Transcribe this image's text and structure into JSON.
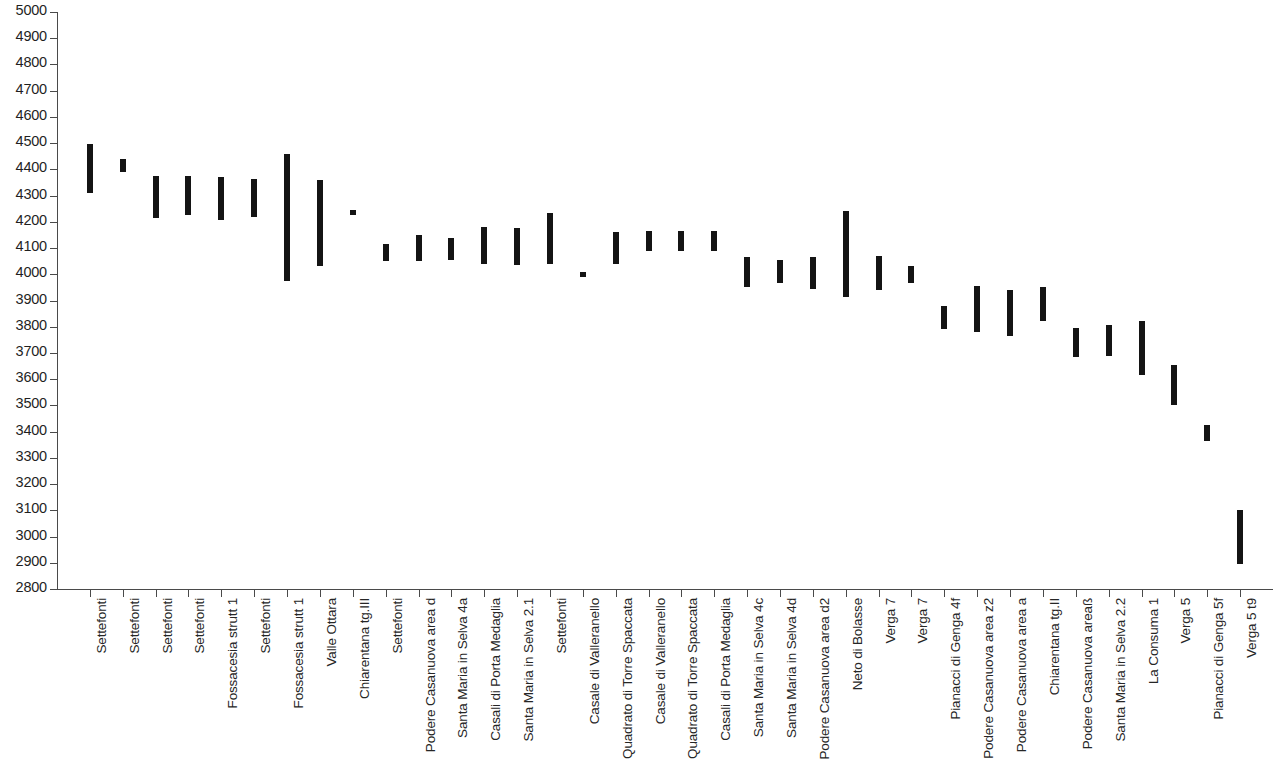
{
  "chart_data": {
    "type": "bar",
    "subtype": "floating-range-bar",
    "title": "",
    "subtitle": "",
    "xlabel": "",
    "ylabel": "",
    "ylim": [
      2800,
      5000
    ],
    "ytick_step": 100,
    "yticks": [
      5000,
      4900,
      4800,
      4700,
      4600,
      4500,
      4400,
      4300,
      4200,
      4100,
      4000,
      3900,
      3800,
      3700,
      3600,
      3500,
      3400,
      3300,
      3200,
      3100,
      3000,
      2900,
      2800
    ],
    "grid": false,
    "legend": null,
    "bar_color": "#141414",
    "axis_color": "#4a4a4a",
    "categories": [
      "Settefonti",
      "Settefonti",
      "Settefonti",
      "Settefonti",
      "Fossacesia strutt 1",
      "Settefonti",
      "Fossacesia strutt 1",
      "Valle Ottara",
      "Chiarentana tg.III",
      "Settefonti",
      "Podere Casanuova area d",
      "Santa Maria in Selva 4a",
      "Casali di Porta Medaglia",
      "Santa Maria in Selva 2.1",
      "Settefonti",
      "Casale di Valleranello",
      "Quadrato di Torre Spaccata",
      "Casale di Valleranello",
      "Quadrato di Torre Spaccata",
      "Casali di Porta Medaglia",
      "Santa Maria in Selva 4c",
      "Santa Maria in Selva 4d",
      "Podere Casanuova area d2",
      "Neto di Bolasse",
      "Verga 7",
      "Verga 7",
      "Pianacci di Genga 4f",
      "Podere Casanuova area z2",
      "Podere Casanuova area a",
      "Chiarentana tg.II",
      "Podere Casanuova areaß",
      "Santa Maria in Selva 2.2",
      "La Consuma 1",
      "Verga 5",
      "Pianacci di Genga 5f",
      "Verga 5 t9"
    ],
    "series": [
      {
        "name": "range_low",
        "values": [
          4310,
          4390,
          4215,
          4225,
          4205,
          4220,
          3975,
          4030,
          4225,
          4050,
          4050,
          4055,
          4040,
          4035,
          4040,
          3990,
          4040,
          4090,
          4090,
          4090,
          3950,
          3965,
          3945,
          3915,
          3940,
          3965,
          3790,
          3780,
          3765,
          3820,
          3685,
          3690,
          3615,
          3500,
          3365,
          2895
        ]
      },
      {
        "name": "range_high",
        "values": [
          4495,
          4440,
          4375,
          4375,
          4370,
          4365,
          4460,
          4360,
          4245,
          4115,
          4150,
          4140,
          4180,
          4175,
          4235,
          4010,
          4160,
          4165,
          4165,
          4165,
          4065,
          4055,
          4065,
          4240,
          4070,
          4030,
          3880,
          3955,
          3940,
          3950,
          3795,
          3805,
          3820,
          3655,
          3425,
          3100
        ]
      }
    ]
  }
}
